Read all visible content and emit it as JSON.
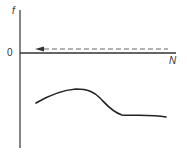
{
  "diagram": {
    "y_axis_label": "f",
    "x_axis_label": "N",
    "origin_label": "0",
    "axis_color": "#333333",
    "curve_color": "#222222",
    "dashed_arrow_color": "#555555",
    "dashed_arrow": {
      "direction": "left",
      "y_level": "just above zero line"
    },
    "curve": {
      "description": "curve below zero axis: rises to a peak, falls steeply, then levels off",
      "points": [
        [
          36,
          103
        ],
        [
          50,
          95
        ],
        [
          65,
          90
        ],
        [
          78,
          89
        ],
        [
          88,
          91
        ],
        [
          100,
          98
        ],
        [
          110,
          108
        ],
        [
          122,
          115
        ],
        [
          145,
          114
        ],
        [
          166,
          117
        ]
      ]
    }
  }
}
